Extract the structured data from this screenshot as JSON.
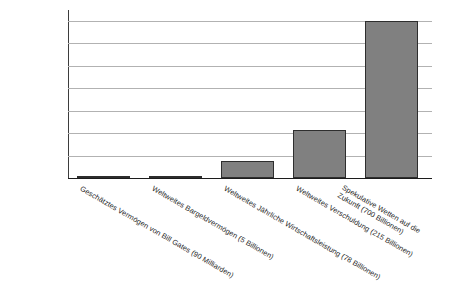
{
  "chart_data": {
    "type": "bar",
    "title": "",
    "subtitle": "",
    "xlabel": "",
    "ylabel": "",
    "categories": [
      "Geschätztes Vermögen von Bill Gates (90 Milliarden)",
      "Weltweites Bargeldvermögen (5 Billionen)",
      "Weltweites Jährliche Wirtschaftsleistung (78 Billionen)",
      "Weltweites Verschuldung (215 Billionen)",
      "Spekulative Wetten auf die\nZukunft (700 Billionen)"
    ],
    "values": [
      90,
      5000,
      78000,
      215000,
      700000
    ],
    "ylim": [
      0,
      700000
    ],
    "yticks": [
      0,
      100000,
      200000,
      300000,
      400000,
      500000,
      600000,
      700000
    ],
    "ytick_labels": [
      "0",
      "100000",
      "200000",
      "300000",
      "400000",
      "500000",
      "600000",
      "700000"
    ],
    "grid": true,
    "legend": null,
    "legend_position": "none",
    "bar_color": "#808080",
    "bar_edge_color": "#2e2e2e",
    "gridline_color": "#b2b2b2",
    "axis_color": "#1c1c1c",
    "background_color": "#ffffff",
    "label_rotation_deg": 30
  }
}
